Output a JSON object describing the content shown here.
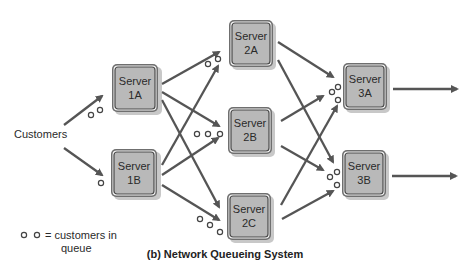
{
  "diagram": {
    "caption": "(b) Network Queueing System",
    "source_label": "Customers",
    "legend": {
      "symbol_label_line1": "= customers in",
      "symbol_label_line2": "queue"
    },
    "servers": [
      {
        "id": "1A",
        "line1": "Server",
        "line2": "1A"
      },
      {
        "id": "1B",
        "line1": "Server",
        "line2": "1B"
      },
      {
        "id": "2A",
        "line1": "Server",
        "line2": "2A"
      },
      {
        "id": "2B",
        "line1": "Server",
        "line2": "2B"
      },
      {
        "id": "2C",
        "line1": "Server",
        "line2": "2C"
      },
      {
        "id": "3A",
        "line1": "Server",
        "line2": "3A"
      },
      {
        "id": "3B",
        "line1": "Server",
        "line2": "3B"
      }
    ],
    "queues": {
      "1A": 2,
      "1B": 1,
      "2A": 2,
      "2B": 3,
      "2C": 3,
      "3A": 3,
      "3B": 3
    },
    "colors": {
      "arrow": "#555555",
      "server_fill": "#b9b9b9",
      "server_frame": "#6f6f6f"
    }
  }
}
